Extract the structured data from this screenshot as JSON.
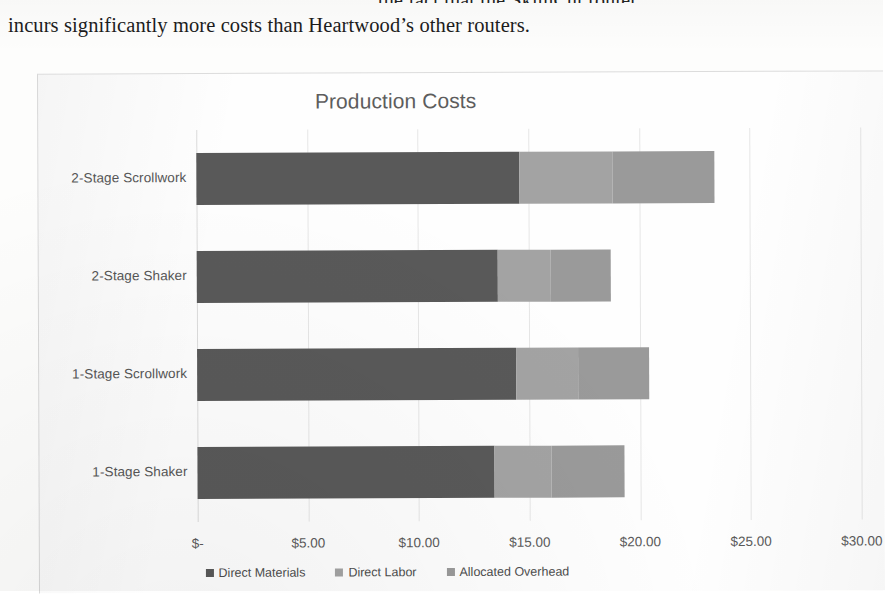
{
  "document": {
    "paragraph_line_clipped": "the fact that the SkimCut router",
    "paragraph_line_2": "incurs significantly more costs than Heartwood’s other routers."
  },
  "chart_data": {
    "type": "bar",
    "orientation": "horizontal",
    "stacked": true,
    "title": "Production Costs",
    "xlabel": "",
    "ylabel": "",
    "xlim": [
      0,
      30
    ],
    "grid": true,
    "legend_position": "bottom",
    "categories": [
      "1-Stage Shaker",
      "1-Stage Scrollwork",
      "2-Stage Shaker",
      "2-Stage Scrollwork"
    ],
    "tick_labels": [
      "$-",
      "$5.00",
      "$10.00",
      "$15.00",
      "$20.00",
      "$25.00",
      "$30.00"
    ],
    "tick_values": [
      0,
      5,
      10,
      15,
      20,
      25,
      30
    ],
    "series": [
      {
        "name": "Direct Materials",
        "color": "#595959",
        "values": [
          13.4,
          14.4,
          13.6,
          14.6
        ]
      },
      {
        "name": "Direct Labor",
        "color": "#a3a3a3",
        "values": [
          2.6,
          2.8,
          2.4,
          4.2
        ]
      },
      {
        "name": "Allocated Overhead",
        "color": "#9a9a9a",
        "values": [
          3.3,
          3.2,
          2.7,
          4.6
        ]
      }
    ],
    "totals": [
      19.3,
      20.4,
      18.7,
      23.4
    ]
  }
}
